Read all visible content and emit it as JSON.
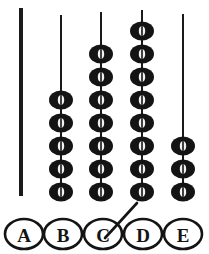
{
  "figure": {
    "background_color": "#ffffff",
    "ink_color": "#141414",
    "bead_hole_color": "#f2f2f0",
    "width": 209,
    "height": 254
  },
  "rods": [
    {
      "id": "A",
      "label": "A",
      "bead_count": 0,
      "rod_x": 21,
      "rod_top_y": 8,
      "rod_bottom_y": 196,
      "rod_thickness": 4,
      "beads_bottom_y": 192,
      "bead_spacing": 22,
      "bead_rx": 11,
      "bead_ry": 9,
      "hole_rx": 3.2,
      "hole_ry": 4.6
    },
    {
      "id": "B",
      "label": "B",
      "bead_count": 5,
      "rod_x": 61,
      "rod_top_y": 15,
      "rod_bottom_y": 196,
      "rod_thickness": 2,
      "beads_bottom_y": 192,
      "bead_spacing": 23,
      "bead_rx": 12,
      "bead_ry": 9.5,
      "hole_rx": 3.2,
      "hole_ry": 4.8
    },
    {
      "id": "C",
      "label": "C",
      "bead_count": 7,
      "rod_x": 101,
      "rod_top_y": 12,
      "rod_bottom_y": 196,
      "rod_thickness": 2,
      "beads_bottom_y": 192,
      "bead_spacing": 23,
      "bead_rx": 12,
      "bead_ry": 9.5,
      "hole_rx": 3.2,
      "hole_ry": 4.8
    },
    {
      "id": "D",
      "label": "D",
      "bead_count": 8,
      "rod_x": 142,
      "rod_top_y": 10,
      "rod_bottom_y": 196,
      "rod_thickness": 2,
      "beads_bottom_y": 192,
      "bead_spacing": 23,
      "bead_rx": 12,
      "bead_ry": 9.5,
      "hole_rx": 3.2,
      "hole_ry": 4.8
    },
    {
      "id": "E",
      "label": "E",
      "bead_count": 3,
      "rod_x": 183,
      "rod_top_y": 14,
      "rod_bottom_y": 196,
      "rod_thickness": 2,
      "beads_bottom_y": 192,
      "bead_spacing": 23,
      "bead_rx": 12,
      "bead_ry": 9.5,
      "hole_rx": 3.2,
      "hole_ry": 4.8
    }
  ],
  "labels": [
    {
      "text": "A",
      "cx": 24,
      "cy": 234,
      "rx": 19,
      "ry": 15
    },
    {
      "text": "B",
      "cx": 63,
      "cy": 234,
      "rx": 19,
      "ry": 15
    },
    {
      "text": "C",
      "cx": 103,
      "cy": 234,
      "rx": 19,
      "ry": 15
    },
    {
      "text": "D",
      "cx": 143,
      "cy": 234,
      "rx": 19,
      "ry": 15
    },
    {
      "text": "E",
      "cx": 183,
      "cy": 234,
      "rx": 19,
      "ry": 15
    }
  ],
  "pointer": {
    "name": "leader-line-to-c",
    "x1": 105,
    "y1": 238,
    "x2": 137,
    "y2": 203
  },
  "chart_data": {
    "type": "bar",
    "xlabel": "Rod",
    "ylabel": "Number of beads",
    "categories": [
      "A",
      "B",
      "C",
      "D",
      "E"
    ],
    "values": [
      0,
      5,
      7,
      8,
      3
    ],
    "ylim": [
      0,
      8
    ],
    "grid": false,
    "legend": "none",
    "annotations": [
      "leader line pointing from label C upward to the right"
    ]
  }
}
